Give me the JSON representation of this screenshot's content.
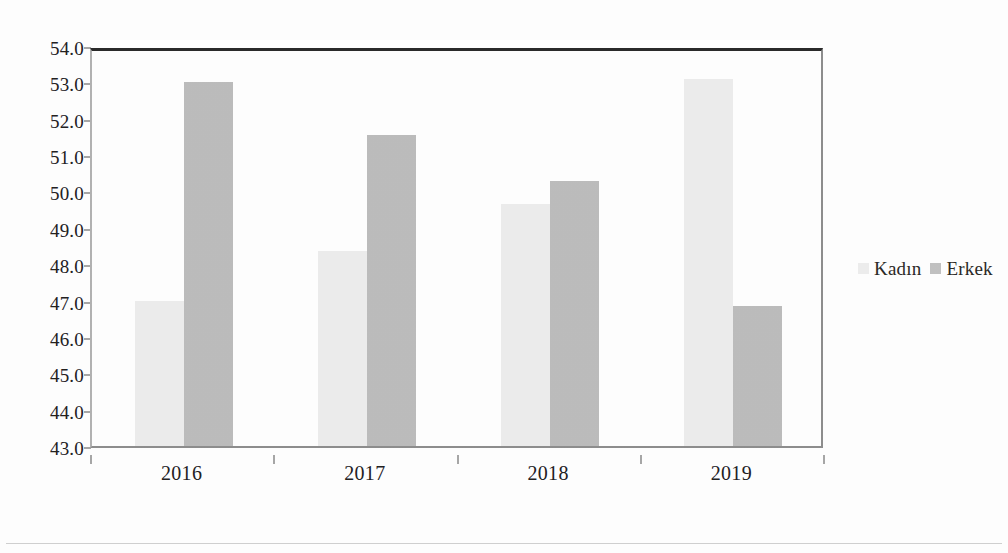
{
  "chart_data": {
    "type": "bar",
    "title": "",
    "subtitle": "",
    "xlabel": "",
    "ylabel": "",
    "categories": [
      "2016",
      "2017",
      "2018",
      "2019"
    ],
    "series": [
      {
        "name": "Kadın",
        "color": "#ededed",
        "values": [
          47.0,
          48.35,
          49.65,
          53.1
        ]
      },
      {
        "name": "Erkek",
        "color": "#bdbdbd",
        "values": [
          53.0,
          51.55,
          50.3,
          46.85
        ]
      }
    ],
    "ylim": [
      43.0,
      54.0
    ],
    "ytick_step": 1.0,
    "ytick_labels": [
      "54.0",
      "53.0",
      "52.0",
      "51.0",
      "50.0",
      "49.0",
      "48.0",
      "47.0",
      "46.0",
      "45.0",
      "44.0",
      "43.0"
    ],
    "ytick_values": [
      54.0,
      53.0,
      52.0,
      51.0,
      50.0,
      49.0,
      48.0,
      47.0,
      46.0,
      45.0,
      44.0,
      43.0
    ],
    "grid": false,
    "legend_position": "right",
    "legend": [
      "Kadın",
      "Erkek"
    ]
  },
  "legend": {
    "entries": [
      {
        "label": "Kadın",
        "swatch": "kadin-swatch"
      },
      {
        "label": "Erkek",
        "swatch": "erkek-swatch"
      }
    ]
  }
}
